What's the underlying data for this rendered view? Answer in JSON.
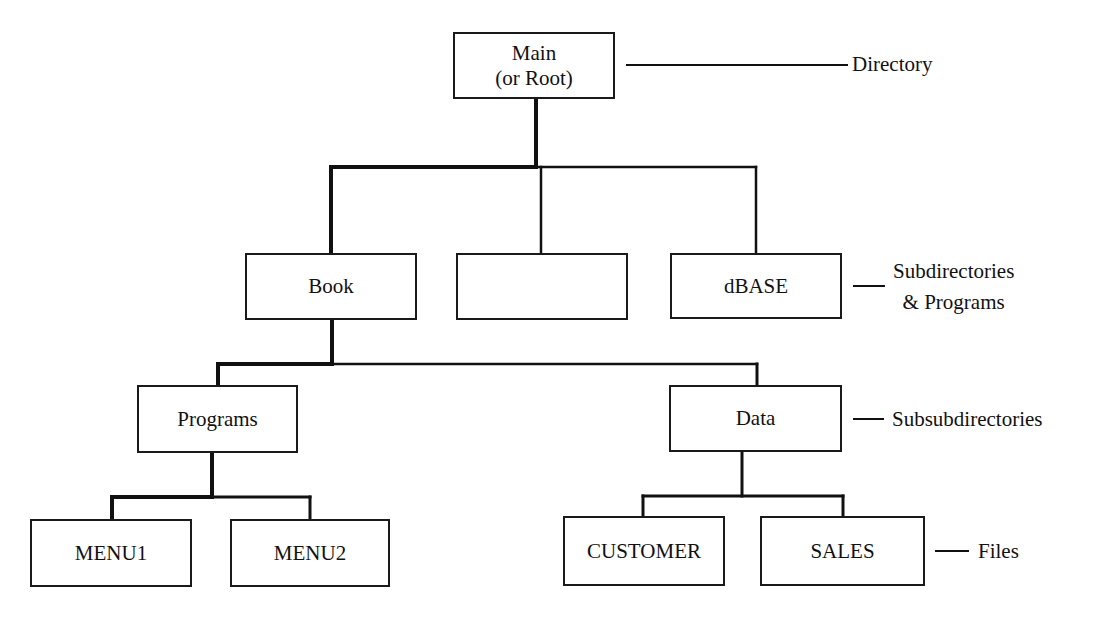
{
  "diagram": {
    "type": "directory-tree",
    "nodes": {
      "root": {
        "line1": "Main",
        "line2": "(or Root)"
      },
      "book": "Book",
      "unnamed": "",
      "dbase": "dBASE",
      "programs": "Programs",
      "data": "Data",
      "menu1": "MENU1",
      "menu2": "MENU2",
      "customer": "CUSTOMER",
      "sales": "SALES"
    },
    "level_labels": {
      "directory": "Directory",
      "subdirectories_line1": "Subdirectories",
      "subdirectories_line2": "& Programs",
      "subsubdirectories": "Subsubdirectories",
      "files": "Files"
    },
    "edges": [
      [
        "root",
        "book"
      ],
      [
        "root",
        "unnamed"
      ],
      [
        "root",
        "dbase"
      ],
      [
        "book",
        "programs"
      ],
      [
        "book",
        "data"
      ],
      [
        "programs",
        "menu1"
      ],
      [
        "programs",
        "menu2"
      ],
      [
        "data",
        "customer"
      ],
      [
        "data",
        "sales"
      ]
    ]
  }
}
